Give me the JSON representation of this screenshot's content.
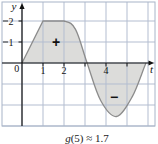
{
  "colors": {
    "background": "#ffffff",
    "grid": "#b3bdd0",
    "frame": "#a8b4c8",
    "region_fill": "#dcdcda",
    "curve_stroke": "#8c8c8c",
    "axis": "#111111",
    "label_text": "#111111"
  },
  "chart_data": {
    "type": "area",
    "title": "",
    "xlabel": "t",
    "ylabel": "y",
    "origin_label": "0",
    "grid": true,
    "xlim": [
      0,
      6.3
    ],
    "ylim": [
      -3,
      2.9
    ],
    "x_ticks": [
      1,
      2,
      3,
      4,
      5
    ],
    "x_tick_labels": [
      {
        "value": 1,
        "label": "1"
      },
      {
        "value": 2,
        "label": "2"
      },
      {
        "value": 4,
        "label": "4"
      }
    ],
    "y_ticks": [
      1,
      2
    ],
    "y_tick_labels": [
      {
        "value": 1,
        "label": "1"
      },
      {
        "value": 2,
        "label": "2"
      }
    ],
    "curve_segments": [
      {
        "type": "line",
        "points": [
          [
            0,
            0
          ],
          [
            1,
            2
          ],
          [
            2,
            2
          ]
        ]
      },
      {
        "type": "smooth",
        "points": [
          [
            1,
            2
          ],
          [
            2,
            2
          ],
          [
            2.55,
            1.6
          ],
          [
            3.1,
            0
          ],
          [
            3.75,
            -1.8
          ],
          [
            4.5,
            -2.55
          ],
          [
            5.25,
            -1.6
          ],
          [
            5.9,
            0
          ],
          [
            6.4,
            1.2
          ]
        ],
        "context_endpoints": true
      }
    ],
    "regions": [
      {
        "sign": "positive",
        "label": "+",
        "x_range": [
          0,
          3.1
        ],
        "label_pos": [
          1.62,
          1.0
        ]
      },
      {
        "sign": "negative",
        "label": "−",
        "x_range": [
          3.1,
          5.9
        ],
        "label_pos": [
          4.38,
          -1.62
        ]
      }
    ],
    "caption": "g(5) ≈ 1.7",
    "caption_var": "g",
    "caption_rest": "(5) ≈ 1.7"
  }
}
